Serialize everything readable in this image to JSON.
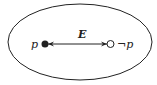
{
  "diagram": {
    "left_label": "p",
    "right_label": "¬p",
    "edge_label": "E",
    "colors": {
      "stroke": "#222222",
      "background": "#ffffff"
    }
  }
}
